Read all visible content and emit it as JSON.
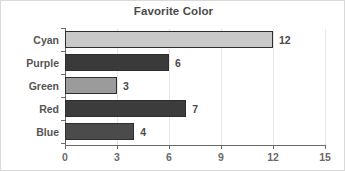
{
  "chart_data": {
    "type": "bar",
    "orientation": "horizontal",
    "title": "Favorite Color",
    "xlabel": "",
    "ylabel": "",
    "categories": [
      "Cyan",
      "Purple",
      "Green",
      "Red",
      "Blue"
    ],
    "values": [
      12,
      6,
      3,
      7,
      4
    ],
    "value_labels": [
      "12",
      "6",
      "3",
      "7",
      "4"
    ],
    "bar_colors": [
      "#c9c9c9",
      "#3a3a3a",
      "#9b9b9b",
      "#3c3c3c",
      "#4b4b4b"
    ],
    "bar_edge_color": "#2e2e2e",
    "xlim": [
      0,
      15
    ],
    "xticks": [
      0,
      3,
      6,
      9,
      12,
      15
    ],
    "xtick_labels": [
      "0",
      "3",
      "6",
      "9",
      "12",
      "15"
    ],
    "grid": true,
    "grid_axis": "x",
    "grid_color": "#e8e8e8",
    "legend": "none",
    "background": "#ffffff",
    "border_color": "#d9d9d9",
    "axis_color": "#6b6b6b",
    "text_color": "#4a4a4a"
  }
}
